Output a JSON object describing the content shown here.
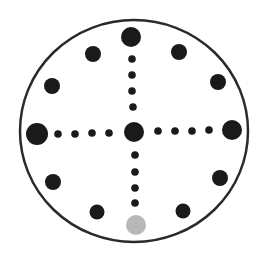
{
  "diagram": {
    "type": "dot-clock-pattern",
    "outer_circle": {
      "cx": 134,
      "cy": 131,
      "rx": 114,
      "ry": 111,
      "stroke": "#2a2a2a",
      "stroke_width": 2.5
    },
    "colors": {
      "dot": "#1a1a1a",
      "highlight_dot": "#b8b8b8",
      "background": "#ffffff"
    },
    "large_dots": [
      {
        "name": "top",
        "cx": 131,
        "cy": 37,
        "r": 10
      },
      {
        "name": "center",
        "cx": 134,
        "cy": 132,
        "r": 10
      },
      {
        "name": "left",
        "cx": 37,
        "cy": 134,
        "r": 11
      },
      {
        "name": "right",
        "cx": 232,
        "cy": 130,
        "r": 10
      }
    ],
    "highlight_dot": {
      "name": "bottom",
      "cx": 136,
      "cy": 225,
      "r": 10
    },
    "medium_dots": [
      {
        "cx": 93,
        "cy": 54,
        "r": 8
      },
      {
        "cx": 179,
        "cy": 52,
        "r": 8
      },
      {
        "cx": 52,
        "cy": 86,
        "r": 8
      },
      {
        "cx": 218,
        "cy": 82,
        "r": 8
      },
      {
        "cx": 53,
        "cy": 182,
        "r": 8
      },
      {
        "cx": 220,
        "cy": 178,
        "r": 8
      },
      {
        "cx": 97,
        "cy": 212,
        "r": 7.5
      },
      {
        "cx": 183,
        "cy": 211,
        "r": 7.5
      }
    ],
    "small_dots": [
      {
        "cx": 132,
        "cy": 59,
        "r": 3.8
      },
      {
        "cx": 132,
        "cy": 75,
        "r": 3.8
      },
      {
        "cx": 132,
        "cy": 91,
        "r": 3.8
      },
      {
        "cx": 133,
        "cy": 107,
        "r": 3.8
      },
      {
        "cx": 135,
        "cy": 155,
        "r": 3.8
      },
      {
        "cx": 135,
        "cy": 172,
        "r": 3.8
      },
      {
        "cx": 135,
        "cy": 188,
        "r": 3.8
      },
      {
        "cx": 135,
        "cy": 203,
        "r": 3.8
      },
      {
        "cx": 58,
        "cy": 134,
        "r": 3.8
      },
      {
        "cx": 75,
        "cy": 134,
        "r": 3.8
      },
      {
        "cx": 92,
        "cy": 133,
        "r": 3.8
      },
      {
        "cx": 109,
        "cy": 133,
        "r": 3.8
      },
      {
        "cx": 158,
        "cy": 131,
        "r": 3.8
      },
      {
        "cx": 175,
        "cy": 131,
        "r": 3.8
      },
      {
        "cx": 192,
        "cy": 131,
        "r": 3.8
      },
      {
        "cx": 209,
        "cy": 130,
        "r": 3.8
      }
    ]
  }
}
